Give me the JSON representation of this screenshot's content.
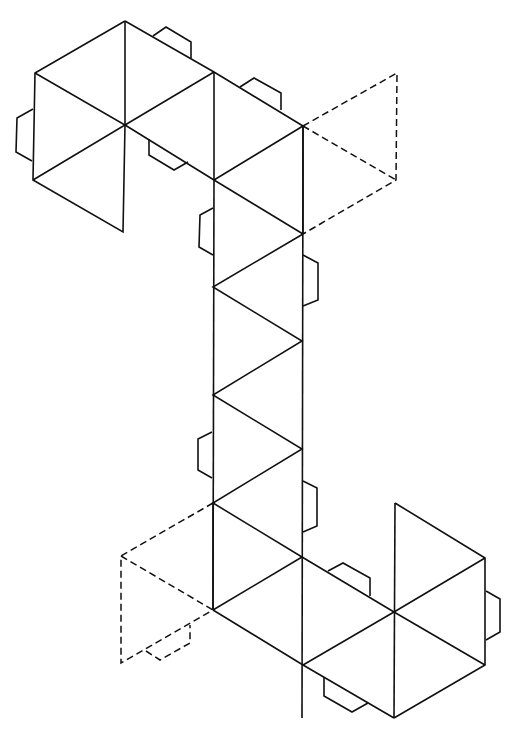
{
  "diagram": {
    "type": "polyhedron-net",
    "colors": {
      "line": "#111111",
      "background": "#ffffff"
    },
    "solid_lines": [
      [
        [
          125,
          21
        ],
        [
          35,
          73
        ],
        [
          33,
          180
        ],
        [
          123,
          232
        ],
        [
          125,
          125
        ]
      ],
      [
        [
          125,
          21
        ],
        [
          125,
          125
        ]
      ],
      [
        [
          35,
          73
        ],
        [
          125,
          125
        ],
        [
          33,
          180
        ]
      ],
      [
        [
          125,
          125
        ],
        [
          214,
          72
        ]
      ],
      [
        [
          125,
          21
        ],
        [
          214,
          72
        ],
        [
          303,
          126
        ]
      ],
      [
        [
          125,
          125
        ],
        [
          214,
          180
        ],
        [
          303,
          126
        ]
      ],
      [
        [
          214,
          72
        ],
        [
          214,
          180
        ]
      ],
      [
        [
          303,
          126
        ],
        [
          303,
          234
        ]
      ],
      [
        [
          214,
          180
        ],
        [
          303,
          234
        ]
      ],
      [
        [
          214,
          180
        ],
        [
          213,
          610
        ]
      ],
      [
        [
          303,
          126
        ],
        [
          302,
          718
        ]
      ],
      [
        [
          303,
          234
        ],
        [
          213,
          287
        ],
        [
          302,
          341
        ],
        [
          213,
          395
        ],
        [
          302,
          449
        ],
        [
          213,
          503
        ],
        [
          302,
          557
        ]
      ],
      [
        [
          213,
          503
        ],
        [
          213,
          610
        ]
      ],
      [
        [
          213,
          610
        ],
        [
          302,
          557
        ]
      ],
      [
        [
          213,
          610
        ],
        [
          303,
          665
        ],
        [
          394,
          718
        ]
      ],
      [
        [
          302,
          557
        ],
        [
          394,
          612
        ],
        [
          485,
          558
        ]
      ],
      [
        [
          394,
          612
        ],
        [
          303,
          665
        ]
      ],
      [
        [
          395,
          503
        ],
        [
          394,
          718
        ]
      ],
      [
        [
          395,
          503
        ],
        [
          485,
          558
        ],
        [
          485,
          665
        ],
        [
          394,
          718
        ]
      ],
      [
        [
          394,
          612
        ],
        [
          485,
          665
        ]
      ]
    ],
    "dashed_lines": [
      [
        [
          303,
          126
        ],
        [
          397,
          73
        ],
        [
          396,
          180
        ],
        [
          303,
          234
        ]
      ],
      [
        [
          303,
          126
        ],
        [
          396,
          180
        ]
      ],
      [
        [
          213,
          503
        ],
        [
          121,
          556
        ],
        [
          121,
          663
        ],
        [
          213,
          610
        ]
      ],
      [
        [
          121,
          556
        ],
        [
          213,
          610
        ]
      ]
    ],
    "tabs": [
      {
        "name": "tab-hex1-left",
        "points": [
          [
            33,
            109
          ],
          [
            17,
            118
          ],
          [
            16,
            152
          ],
          [
            32,
            161
          ]
        ],
        "dashed": false
      },
      {
        "name": "tab-hex1-top",
        "points": [
          [
            153,
            36
          ],
          [
            166,
            27
          ],
          [
            191,
            42
          ],
          [
            191,
            58
          ]
        ],
        "dashed": false
      },
      {
        "name": "tab-top-right",
        "points": [
          [
            240,
            87
          ],
          [
            254,
            78
          ],
          [
            281,
            93
          ],
          [
            281,
            110
          ]
        ],
        "dashed": false
      },
      {
        "name": "tab-hex1-inner",
        "points": [
          [
            149,
            139
          ],
          [
            149,
            155
          ],
          [
            174,
            170
          ],
          [
            188,
            162
          ]
        ],
        "dashed": false
      },
      {
        "name": "tab-column-left-upper",
        "points": [
          [
            213,
            208
          ],
          [
            200,
            215
          ],
          [
            199,
            247
          ],
          [
            213,
            255
          ]
        ],
        "dashed": false
      },
      {
        "name": "tab-column-right-upper",
        "points": [
          [
            303,
            255
          ],
          [
            318,
            263
          ],
          [
            318,
            300
          ],
          [
            303,
            306
          ]
        ],
        "dashed": false
      },
      {
        "name": "tab-column-left-lower",
        "points": [
          [
            212,
            432
          ],
          [
            198,
            439
          ],
          [
            198,
            470
          ],
          [
            212,
            478
          ]
        ],
        "dashed": false
      },
      {
        "name": "tab-column-right-lower",
        "points": [
          [
            303,
            481
          ],
          [
            317,
            488
          ],
          [
            317,
            526
          ],
          [
            303,
            532
          ]
        ],
        "dashed": false
      },
      {
        "name": "tab-hex2-top",
        "points": [
          [
            328,
            571
          ],
          [
            343,
            563
          ],
          [
            370,
            578
          ],
          [
            370,
            596
          ]
        ],
        "dashed": false
      },
      {
        "name": "tab-hex2-right",
        "points": [
          [
            486,
            591
          ],
          [
            500,
            599
          ],
          [
            500,
            632
          ],
          [
            486,
            640
          ]
        ],
        "dashed": false
      },
      {
        "name": "tab-hex2-bottom",
        "points": [
          [
            324,
            677
          ],
          [
            324,
            696
          ],
          [
            352,
            712
          ],
          [
            368,
            703
          ]
        ],
        "dashed": false
      },
      {
        "name": "tab-dashed-bottom",
        "points": [
          [
            146,
            651
          ],
          [
            160,
            660
          ],
          [
            190,
            643
          ],
          [
            190,
            625
          ]
        ],
        "dashed": true
      }
    ]
  }
}
